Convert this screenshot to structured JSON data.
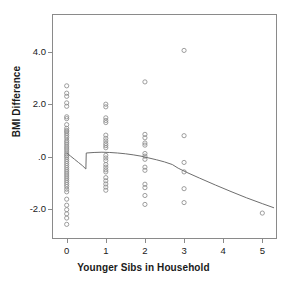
{
  "chart_data": {
    "type": "scatter",
    "title": "",
    "xlabel": "Younger Sibs in Household",
    "ylabel": "BMI Difference",
    "xlim": [
      -0.35,
      5.35
    ],
    "ylim": [
      -3.1,
      5.4
    ],
    "grid": false,
    "legend": null,
    "xticks": [
      "0",
      "1",
      "2",
      "3",
      "4",
      "5"
    ],
    "xtick_values": [
      0,
      1,
      2,
      3,
      4,
      5
    ],
    "yticks": [
      "4.0",
      "2.0",
      ".0",
      "-2.0"
    ],
    "ytick_values": [
      4.0,
      2.0,
      0.0,
      -2.0
    ],
    "marker": "open-circle",
    "marker_color": "#8c8c8c",
    "line_color": "#6e6e6e",
    "frame_color": "#8a8a8a",
    "series": [
      {
        "name": "BMI difference by number of younger siblings",
        "points": [
          [
            0,
            2.7
          ],
          [
            0,
            2.42
          ],
          [
            0,
            2.3
          ],
          [
            0,
            2.05
          ],
          [
            0,
            1.92
          ],
          [
            0,
            1.52
          ],
          [
            0,
            1.45
          ],
          [
            0,
            1.22
          ],
          [
            0,
            1.08
          ],
          [
            0,
            1.0
          ],
          [
            0,
            0.95
          ],
          [
            0,
            0.88
          ],
          [
            0,
            0.8
          ],
          [
            0,
            0.72
          ],
          [
            0,
            0.62
          ],
          [
            0,
            0.55
          ],
          [
            0,
            0.48
          ],
          [
            0,
            0.4
          ],
          [
            0,
            0.33
          ],
          [
            0,
            0.26
          ],
          [
            0,
            0.18
          ],
          [
            0,
            0.1
          ],
          [
            0,
            0.04
          ],
          [
            0,
            -0.02
          ],
          [
            0,
            -0.1
          ],
          [
            0,
            -0.18
          ],
          [
            0,
            -0.26
          ],
          [
            0,
            -0.34
          ],
          [
            0,
            -0.42
          ],
          [
            0,
            -0.5
          ],
          [
            0,
            -0.58
          ],
          [
            0,
            -0.66
          ],
          [
            0,
            -0.74
          ],
          [
            0,
            -0.82
          ],
          [
            0,
            -0.9
          ],
          [
            0,
            -0.98
          ],
          [
            0,
            -1.06
          ],
          [
            0,
            -1.14
          ],
          [
            0,
            -1.24
          ],
          [
            0,
            -1.34
          ],
          [
            0,
            -1.62
          ],
          [
            0,
            -1.85
          ],
          [
            0,
            -2.02
          ],
          [
            0,
            -2.18
          ],
          [
            0,
            -2.34
          ],
          [
            0,
            -2.58
          ],
          [
            1,
            2.0
          ],
          [
            1,
            1.9
          ],
          [
            1,
            1.48
          ],
          [
            1,
            1.38
          ],
          [
            1,
            1.3
          ],
          [
            1,
            0.82
          ],
          [
            1,
            0.7
          ],
          [
            1,
            0.6
          ],
          [
            1,
            0.5
          ],
          [
            1,
            0.42
          ],
          [
            1,
            0.34
          ],
          [
            1,
            0.05
          ],
          [
            1,
            -0.05
          ],
          [
            1,
            -0.15
          ],
          [
            1,
            -0.3
          ],
          [
            1,
            -0.4
          ],
          [
            1,
            -0.5
          ],
          [
            1,
            -0.58
          ],
          [
            1,
            -0.8
          ],
          [
            1,
            -0.92
          ],
          [
            1,
            -1.04
          ],
          [
            1,
            -1.16
          ],
          [
            1,
            -1.28
          ],
          [
            2,
            2.85
          ],
          [
            2,
            0.85
          ],
          [
            2,
            0.72
          ],
          [
            2,
            0.52
          ],
          [
            2,
            0.44
          ],
          [
            2,
            0.12
          ],
          [
            2,
            0.02
          ],
          [
            2,
            -0.1
          ],
          [
            2,
            -0.4
          ],
          [
            2,
            -0.52
          ],
          [
            2,
            -1.05
          ],
          [
            2,
            -1.18
          ],
          [
            2,
            -1.48
          ],
          [
            2,
            -1.82
          ],
          [
            3,
            4.05
          ],
          [
            3,
            0.8
          ],
          [
            3,
            -0.22
          ],
          [
            3,
            -0.58
          ],
          [
            3,
            -1.22
          ],
          [
            3,
            -1.75
          ],
          [
            5,
            -2.15
          ]
        ]
      }
    ],
    "fit_line": {
      "name": "lowess-smoother",
      "points": [
        [
          0.0,
          0.14
        ],
        [
          0.1,
          0.02
        ],
        [
          0.2,
          -0.1
        ],
        [
          0.3,
          -0.22
        ],
        [
          0.4,
          -0.34
        ],
        [
          0.49,
          -0.47
        ],
        [
          0.5,
          0.14
        ],
        [
          0.7,
          0.16
        ],
        [
          0.9,
          0.17
        ],
        [
          1.1,
          0.16
        ],
        [
          1.3,
          0.14
        ],
        [
          1.5,
          0.11
        ],
        [
          1.7,
          0.07
        ],
        [
          1.9,
          0.02
        ],
        [
          2.1,
          -0.05
        ],
        [
          2.3,
          -0.12
        ],
        [
          2.5,
          -0.2
        ],
        [
          2.7,
          -0.3
        ],
        [
          2.85,
          -0.44
        ],
        [
          3.1,
          -0.62
        ],
        [
          3.4,
          -0.82
        ],
        [
          3.8,
          -1.08
        ],
        [
          4.2,
          -1.33
        ],
        [
          4.6,
          -1.57
        ],
        [
          5.0,
          -1.79
        ],
        [
          5.3,
          -1.95
        ]
      ]
    }
  },
  "axes": {
    "x_title": "Younger Sibs in Household",
    "y_title": "BMI Difference",
    "x_tick_labels": [
      "0",
      "1",
      "2",
      "3",
      "4",
      "5"
    ],
    "y_tick_labels": [
      "4.0",
      "2.0",
      ".0",
      "-2.0"
    ]
  }
}
